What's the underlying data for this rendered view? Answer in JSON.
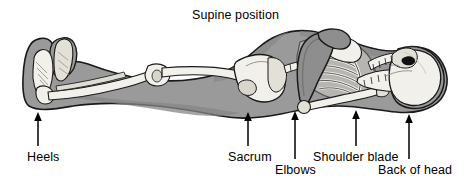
{
  "figure": {
    "title": "Supine position",
    "width": 471,
    "height": 186,
    "background_color": "#ffffff"
  },
  "colors": {
    "background": "#ffffff",
    "body_silhouette": "#9a9a9a",
    "body_silhouette_dark": "#7d7d7d",
    "bone_light": "#f2f0ea",
    "bone_shade": "#d8d5cd",
    "outline": "#1a1a1a",
    "text": "#000000",
    "arrow": "#000000",
    "eye_socket": "#111111"
  },
  "labels": [
    {
      "id": "heels",
      "text": "Heels",
      "arrow_x": 38,
      "arrow_top": 116,
      "arrow_bottom": 146
    },
    {
      "id": "sacrum",
      "text": "Sacrum",
      "arrow_x": 248,
      "arrow_top": 116,
      "arrow_bottom": 146
    },
    {
      "id": "elbows",
      "text": "Elbows",
      "arrow_x": 295,
      "arrow_top": 113,
      "arrow_bottom": 159
    },
    {
      "id": "shoulder-blade",
      "text": "Shoulder blade",
      "arrow_x": 356,
      "arrow_top": 112,
      "arrow_bottom": 146
    },
    {
      "id": "back-of-head",
      "text": "Back of head",
      "arrow_x": 409,
      "arrow_top": 115,
      "arrow_bottom": 159
    }
  ],
  "anatomy": {
    "view": "lateral-supine",
    "facing": "right",
    "parts": [
      "skull",
      "mandible",
      "cervical-vertebrae",
      "rib-cage",
      "sternum",
      "scapula",
      "humerus",
      "radius-ulna",
      "lumbar-vertebrae",
      "pelvis",
      "sacrum",
      "femur",
      "patella",
      "tibia",
      "fibula",
      "calcaneus",
      "foot-bones"
    ]
  }
}
